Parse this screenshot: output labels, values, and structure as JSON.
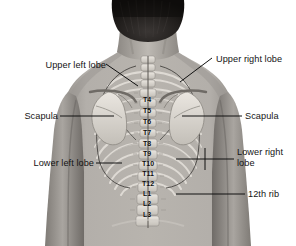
{
  "figure": {
    "background_color": "#ffffff",
    "skin_tone": "#a8a49f",
    "bone_tone": "#dedad4",
    "hair_color": "#1d1b1a",
    "line_color": "#101010",
    "width": 296,
    "height": 246
  },
  "labels": [
    {
      "id": "upper-left-lobe",
      "text": "Upper left lobe",
      "align": "right",
      "x": 28,
      "y": 60
    },
    {
      "id": "upper-right-lobe",
      "text": "Upper right lobe",
      "align": "left",
      "x": 216,
      "y": 54
    },
    {
      "id": "scapula-left",
      "text": "Scapula",
      "align": "right",
      "x": 10,
      "y": 111
    },
    {
      "id": "scapula-right",
      "text": "Scapula",
      "align": "left",
      "x": 245,
      "y": 111
    },
    {
      "id": "lower-left-lobe",
      "text": "Lower left lobe",
      "align": "right",
      "x": 10,
      "y": 158
    },
    {
      "id": "lower-right-lobe",
      "text": "Lower right\nlobe",
      "align": "left",
      "x": 237,
      "y": 147
    },
    {
      "id": "twelfth-rib",
      "text": "12th rib",
      "align": "left",
      "x": 248,
      "y": 189
    }
  ],
  "vertebrae": [
    {
      "id": "T4",
      "text": "T4",
      "x": 147,
      "y": 99
    },
    {
      "id": "T5",
      "text": "T5",
      "x": 147,
      "y": 110
    },
    {
      "id": "T6",
      "text": "T6",
      "x": 147,
      "y": 121
    },
    {
      "id": "T7",
      "text": "T7",
      "x": 147,
      "y": 132
    },
    {
      "id": "T8",
      "text": "T8",
      "x": 147,
      "y": 143
    },
    {
      "id": "T9",
      "text": "T9",
      "x": 147,
      "y": 153
    },
    {
      "id": "T10",
      "text": "T10",
      "x": 148,
      "y": 163
    },
    {
      "id": "T11",
      "text": "T11",
      "x": 148,
      "y": 173
    },
    {
      "id": "T12",
      "text": "T12",
      "x": 148,
      "y": 183
    },
    {
      "id": "L1",
      "text": "L1",
      "x": 147,
      "y": 193
    },
    {
      "id": "L2",
      "text": "L2",
      "x": 147,
      "y": 203
    },
    {
      "id": "L3",
      "text": "L3",
      "x": 147,
      "y": 214
    }
  ]
}
